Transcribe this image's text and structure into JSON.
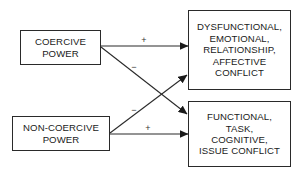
{
  "diagram": {
    "type": "causal-path-diagram",
    "nodes": [
      {
        "id": "coercive",
        "lines": [
          "COERCIVE",
          "POWER"
        ]
      },
      {
        "id": "noncoercive",
        "lines": [
          "NON-COERCIVE",
          "POWER"
        ]
      },
      {
        "id": "dysfunctional",
        "lines": [
          "DYSFUNCTIONAL,",
          "EMOTIONAL,",
          "RELATIONSHIP,",
          "AFFECTIVE",
          "CONFLICT"
        ]
      },
      {
        "id": "functional",
        "lines": [
          "FUNCTIONAL,",
          "TASK,",
          "COGNITIVE,",
          "ISSUE CONFLICT"
        ]
      }
    ],
    "edges": [
      {
        "from": "coercive",
        "to": "dysfunctional",
        "sign": "+"
      },
      {
        "from": "coercive",
        "to": "functional",
        "sign": "−"
      },
      {
        "from": "noncoercive",
        "to": "dysfunctional",
        "sign": "−"
      },
      {
        "from": "noncoercive",
        "to": "functional",
        "sign": "+"
      }
    ],
    "colors": {
      "line": "#2a2a2a",
      "background": "#ffffff"
    }
  }
}
